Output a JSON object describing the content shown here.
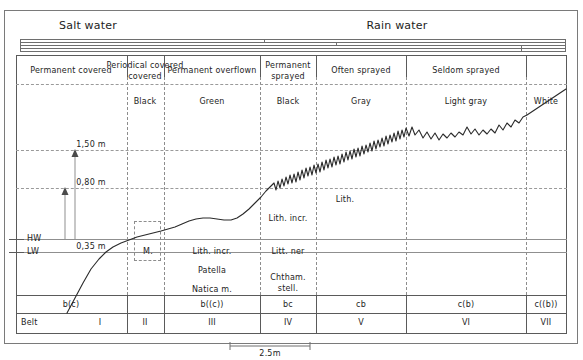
{
  "diagram": {
    "title_left": "Salt water",
    "title_right": "Rain water",
    "scale_label": "2.5m",
    "belt_row_label": "Belt"
  },
  "zones": [
    {
      "exposure": "Permanent covered",
      "color": "",
      "species": [],
      "code": "b(c)",
      "belt": "I"
    },
    {
      "exposure": "Periodical covered",
      "color": "Black",
      "species": [],
      "code": "",
      "belt": "II"
    },
    {
      "exposure": "Permanent overflown",
      "color": "Green",
      "species": [
        "Lith. incr.",
        "Patella",
        "Natica m."
      ],
      "code": "b((c))",
      "belt": "III"
    },
    {
      "exposure": "Permanent sprayed",
      "color": "Black",
      "species": [
        "Lith. incr.",
        "Litt. ner",
        "Chtham.",
        "stell."
      ],
      "code": "bc",
      "belt": "IV"
    },
    {
      "exposure": "Often sprayed",
      "color": "Gray",
      "species": [
        "Lith."
      ],
      "code": "cb",
      "belt": "V"
    },
    {
      "exposure": "Seldom sprayed",
      "color": "Light gray",
      "species": [],
      "code": "c(b)",
      "belt": "VI"
    },
    {
      "exposure": "",
      "color": "White",
      "species": [],
      "code": "c((b))",
      "belt": "VII"
    }
  ],
  "levels": [
    {
      "label": "1,50 m"
    },
    {
      "label": "0,80 m"
    },
    {
      "label": "0,35 m"
    }
  ],
  "tide_marks": [
    {
      "label": "HW"
    },
    {
      "label": "LW"
    }
  ],
  "colors": {
    "ink": "#1d1d1d",
    "rule": "#5a5a5a",
    "dash": "#9a9a9a"
  }
}
